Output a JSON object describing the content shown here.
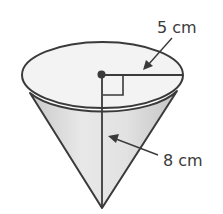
{
  "figure": {
    "type": "cone",
    "labels": {
      "radius": "5 cm",
      "height": "8 cm"
    },
    "measurements": {
      "radius_value": 5,
      "height_value": 8,
      "unit": "cm"
    },
    "colors": {
      "stroke": "#3a3a3a",
      "top_fill": "#f2f2f2",
      "side_fill_light": "#e6e6e6",
      "side_fill_dark": "#cfcfcf",
      "background": "#ffffff"
    }
  }
}
